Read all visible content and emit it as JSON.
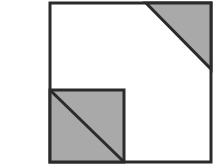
{
  "figure": {
    "canvas": {
      "width": 221,
      "height": 168,
      "background_color": "#ffffff"
    },
    "colors": {
      "shade_fill": "#a9a9a9",
      "line_stroke": "#2b2b2b",
      "unshaded_fill": "#ffffff"
    },
    "stroke_width": 3,
    "shapes": {
      "outer_square": {
        "name": "outer-square",
        "x": 50,
        "y": 3,
        "width": 161,
        "height": 159,
        "fill": "#ffffff",
        "stroke": "#2b2b2b"
      },
      "corner_triangle": {
        "name": "top-right-shaded-triangle",
        "points": "146,3 211,3 211,69",
        "fill": "#a9a9a9",
        "stroke": "#2b2b2b"
      },
      "inner_square": {
        "name": "bottom-left-shaded-square",
        "x": 50,
        "y": 90,
        "width": 74,
        "height": 72,
        "fill": "#a9a9a9",
        "stroke": "#2b2b2b"
      },
      "inner_diagonal": {
        "name": "inner-square-diagonal",
        "x1": 51,
        "y1": 91,
        "x2": 123,
        "y2": 161,
        "stroke": "#2b2b2b"
      }
    }
  }
}
